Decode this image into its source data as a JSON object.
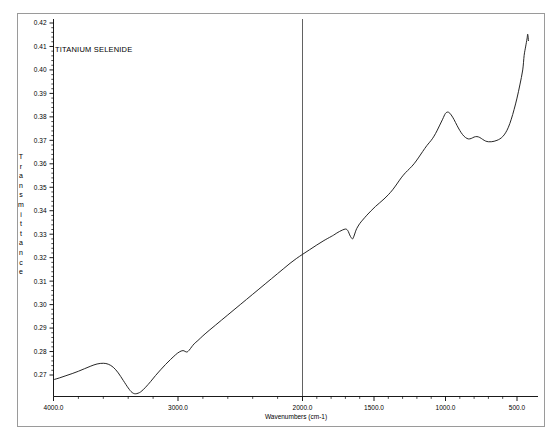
{
  "document": {
    "title": "TITANIUM SELENIDE",
    "background_color": "#ffffff",
    "frame_color": "#9a9a9a",
    "trace_color": "#1a1a1a"
  },
  "chart_data": {
    "type": "line",
    "title": "TITANIUM SELENIDE",
    "xlabel": "Wavenumbers (cm-1)",
    "ylabel": "Transmittance",
    "ylabel_letters": [
      "T",
      "r",
      "a",
      "n",
      "s",
      "m",
      "i",
      "t",
      "t",
      "a",
      "n",
      "c",
      "e"
    ],
    "grid": false,
    "legend": "none",
    "x_axis": {
      "label": "Wavenumbers (cm-1)",
      "direction": "descending",
      "tick_labels": [
        "4000.0",
        "3000.0",
        "2000.0",
        "1500.0",
        "1000.0",
        "500.0"
      ],
      "tick_values": [
        4000,
        3000,
        2000,
        1500,
        1000,
        500
      ],
      "minor_ticks_between": 4,
      "segments": [
        {
          "from": 4000,
          "to": 2000,
          "note": "compressed region"
        },
        {
          "from": 2000,
          "to": 400,
          "note": "expanded region"
        }
      ],
      "break_at": 2000,
      "xlim": [
        4000,
        400
      ]
    },
    "y_axis": {
      "label": "Transmittance",
      "tick_labels": [
        "0.27",
        "0.28",
        "0.29",
        "0.30",
        "0.31",
        "0.32",
        "0.33",
        "0.34",
        "0.35",
        "0.36",
        "0.37",
        "0.38",
        "0.39",
        "0.40",
        "0.41",
        "0.42"
      ],
      "tick_values": [
        0.27,
        0.28,
        0.29,
        0.3,
        0.31,
        0.32,
        0.33,
        0.34,
        0.35,
        0.36,
        0.37,
        0.38,
        0.39,
        0.4,
        0.41,
        0.42
      ],
      "ylim": [
        0.2615,
        0.4235
      ],
      "minor_ticks_between": 4
    },
    "x": [
      4000,
      3950,
      3900,
      3850,
      3800,
      3750,
      3700,
      3650,
      3600,
      3560,
      3520,
      3480,
      3440,
      3400,
      3370,
      3340,
      3300,
      3260,
      3220,
      3180,
      3140,
      3100,
      3060,
      3020,
      2990,
      2960,
      2930,
      2910,
      2890,
      2870,
      2840,
      2800,
      2750,
      2700,
      2650,
      2600,
      2550,
      2500,
      2450,
      2400,
      2350,
      2300,
      2250,
      2200,
      2150,
      2100,
      2050,
      2000,
      1950,
      1900,
      1850,
      1800,
      1780,
      1760,
      1740,
      1720,
      1700,
      1690,
      1680,
      1670,
      1660,
      1650,
      1640,
      1630,
      1620,
      1600,
      1580,
      1550,
      1520,
      1490,
      1460,
      1430,
      1400,
      1370,
      1340,
      1310,
      1280,
      1250,
      1220,
      1190,
      1160,
      1130,
      1100,
      1080,
      1060,
      1040,
      1020,
      1000,
      980,
      960,
      940,
      920,
      900,
      880,
      860,
      840,
      820,
      800,
      780,
      760,
      740,
      720,
      700,
      680,
      660,
      640,
      620,
      600,
      580,
      560,
      540,
      520,
      500,
      480,
      460,
      450,
      440,
      430,
      425,
      420
    ],
    "y": [
      0.268,
      0.2688,
      0.2697,
      0.2706,
      0.2716,
      0.2727,
      0.2738,
      0.2747,
      0.275,
      0.2746,
      0.2733,
      0.2709,
      0.2677,
      0.2645,
      0.2626,
      0.262,
      0.2628,
      0.2648,
      0.2672,
      0.2698,
      0.2722,
      0.2745,
      0.2766,
      0.2786,
      0.2798,
      0.2804,
      0.2798,
      0.2806,
      0.282,
      0.2833,
      0.2847,
      0.2867,
      0.289,
      0.2912,
      0.2934,
      0.2956,
      0.2978,
      0.3,
      0.3022,
      0.3044,
      0.3066,
      0.3088,
      0.311,
      0.3132,
      0.3154,
      0.3176,
      0.3196,
      0.3214,
      0.3234,
      0.3254,
      0.3273,
      0.329,
      0.3297,
      0.3305,
      0.3312,
      0.3318,
      0.3322,
      0.332,
      0.3312,
      0.3297,
      0.3286,
      0.328,
      0.3292,
      0.331,
      0.3325,
      0.3345,
      0.336,
      0.3381,
      0.34,
      0.3418,
      0.3434,
      0.345,
      0.3468,
      0.3489,
      0.3514,
      0.354,
      0.3562,
      0.358,
      0.36,
      0.3625,
      0.3652,
      0.3678,
      0.37,
      0.3718,
      0.374,
      0.3765,
      0.379,
      0.3815,
      0.382,
      0.3808,
      0.3788,
      0.3764,
      0.3742,
      0.3724,
      0.3712,
      0.3706,
      0.3708,
      0.3714,
      0.3716,
      0.3712,
      0.3704,
      0.3697,
      0.3694,
      0.3694,
      0.3696,
      0.37,
      0.3706,
      0.3716,
      0.3732,
      0.3756,
      0.379,
      0.3832,
      0.388,
      0.3936,
      0.4,
      0.4062,
      0.4098,
      0.4132,
      0.4152,
      0.4125
    ],
    "annotations": [
      {
        "text": "TITANIUM SELENIDE",
        "x_px": 55,
        "y_px": 52
      }
    ],
    "features": [
      {
        "name": "local maximum",
        "wavenumber": 3600,
        "transmittance": 0.275
      },
      {
        "name": "absorption minimum",
        "wavenumber": 3340,
        "transmittance": 0.262
      },
      {
        "name": "small shoulder",
        "wavenumber": 2950,
        "transmittance": 0.28
      },
      {
        "name": "local maximum",
        "wavenumber": 1700,
        "transmittance": 0.332
      },
      {
        "name": "sharp dip",
        "wavenumber": 1650,
        "transmittance": 0.328
      },
      {
        "name": "main peak",
        "wavenumber": 1000,
        "transmittance": 0.382
      },
      {
        "name": "shallow dip",
        "wavenumber": 880,
        "transmittance": 0.371
      },
      {
        "name": "minor bump",
        "wavenumber": 800,
        "transmittance": 0.3716
      },
      {
        "name": "broad minimum",
        "wavenumber": 660,
        "transmittance": 0.3694
      },
      {
        "name": "steep terminal rise",
        "wavenumber": 430,
        "transmittance": 0.415
      }
    ]
  }
}
